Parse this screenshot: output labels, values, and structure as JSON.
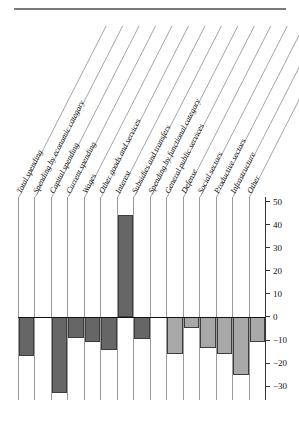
{
  "chart_data": {
    "type": "bar",
    "title": "",
    "subtitle": "",
    "xlabel": "",
    "ylabel": "",
    "ylim": [
      -36,
      52
    ],
    "grid": false,
    "legend_position": "none",
    "orientation": "vertical",
    "zero_reference_line": 0,
    "axis_side": "right",
    "yticks": [
      50,
      40,
      30,
      20,
      10,
      0,
      -10,
      -20,
      -30
    ],
    "ytick_labels": [
      "50",
      "40",
      "30",
      "20",
      "10",
      "0",
      "-10",
      "-20",
      "-30"
    ],
    "categories": [
      "Total spending",
      "Spending by economic category",
      "Capital spending",
      "Current spending",
      "Wages",
      "Other goods and services",
      "Interest",
      "Subsidies and transfers",
      "Spending by functional category",
      "General public services",
      "Defense",
      "Social sectors",
      "Productive sectors",
      "Infrastructure",
      "Other"
    ],
    "values": [
      -17,
      null,
      -33,
      -9,
      -11,
      -14.5,
      44,
      -9.5,
      null,
      -16,
      -5,
      -13.5,
      -16,
      -25,
      -11
    ],
    "bar_colors": [
      "#666666",
      null,
      "#666666",
      "#666666",
      "#666666",
      "#666666",
      "#666666",
      "#666666",
      null,
      "#a8a8a8",
      "#a8a8a8",
      "#a8a8a8",
      "#a8a8a8",
      "#a8a8a8",
      "#a8a8a8"
    ],
    "group_headers": [
      "Spending by economic category",
      "Spending by functional category"
    ],
    "colors": {
      "economic_category_bars": "#666666",
      "functional_category_bars": "#a8a8a8",
      "bar_outline": "#3d3d3d",
      "axis": "#333333",
      "column_separator": "#9a9a9a",
      "top_rule": "#7a7a7a",
      "background": "#ffffff"
    }
  },
  "axis": {
    "ticks": [
      "50",
      "40",
      "30",
      "20",
      "10",
      "0",
      "-10",
      "-20",
      "-30"
    ]
  },
  "labels": {
    "c0": "Total spending",
    "c1": "Spending by economic category",
    "c2": "Capital spending",
    "c3": "Current spending",
    "c4": "Wages",
    "c5": "Other goods and services",
    "c6": "Interest",
    "c7": "Subsidies and transfers",
    "c8": "Spending by functional category",
    "c9": "General public services",
    "c10": "Defense",
    "c11": "Social sectors",
    "c12": "Productive sectors",
    "c13": "Infrastructure",
    "c14": "Other"
  }
}
